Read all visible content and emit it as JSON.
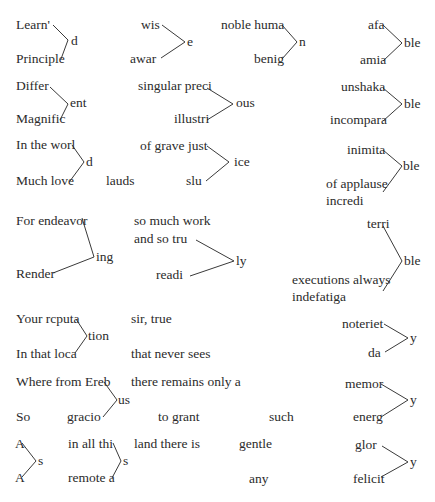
{
  "worksheet": {
    "groups": [
      {
        "id": "learned",
        "stems": [
          "Learn'",
          "Principle"
        ],
        "suffix": "d"
      },
      {
        "id": "wise-aware",
        "stems": [
          "wis",
          "awar"
        ],
        "suffix": "e"
      },
      {
        "id": "human-benign",
        "stems": [
          "noble huma",
          "benig"
        ],
        "suffix": "n"
      },
      {
        "id": "affable-amiable",
        "stems": [
          "afa",
          "amia"
        ],
        "suffix": "ble"
      },
      {
        "id": "different",
        "stems": [
          "Differ",
          "Magnific"
        ],
        "suffix": "ent"
      },
      {
        "id": "precious",
        "stems": [
          "singular preci",
          "illustri"
        ],
        "suffix": "ous"
      },
      {
        "id": "unshakable",
        "stems": [
          "unshaka",
          "incompara"
        ],
        "suffix": "ble"
      },
      {
        "id": "world-loved",
        "stems": [
          "In the worl",
          "Much love"
        ],
        "suffix": "d"
      },
      {
        "id": "justice",
        "stems": [
          "of grave just",
          "slu"
        ],
        "suffix": "ice"
      },
      {
        "id": "inimitable",
        "stems": [
          "inimita",
          "of applause",
          "incredi"
        ],
        "suffix": "ble"
      },
      {
        "id": "endeavoring",
        "stems": [
          "For endeavor",
          "Render"
        ],
        "suffix": "ing"
      },
      {
        "id": "truly",
        "stems": [
          "so much work",
          "and so tru",
          "readi"
        ],
        "suffix": "ly"
      },
      {
        "id": "terrible",
        "stems": [
          "terri",
          "executions always",
          "indefatiga"
        ],
        "suffix": "ble"
      },
      {
        "id": "reputation",
        "stems": [
          "Your rcputa",
          "In that loca"
        ],
        "suffix": "tion"
      },
      {
        "id": "notoriety",
        "stems": [
          "noteriet",
          "da"
        ],
        "suffix": "y"
      },
      {
        "id": "erebus",
        "stems": [
          "Where from Ereb",
          "gracio"
        ],
        "suffix": "us"
      },
      {
        "id": "memory",
        "stems": [
          "memor",
          "energ"
        ],
        "suffix": "y"
      },
      {
        "id": "as",
        "stems": [
          "A",
          "A"
        ],
        "suffix": "s"
      },
      {
        "id": "this",
        "stems": [
          "in all thi",
          "remote a"
        ],
        "suffix": "s"
      },
      {
        "id": "glory",
        "stems": [
          "glor",
          "felicit"
        ],
        "suffix": "y"
      }
    ],
    "loose_words": {
      "lauds": "lauds",
      "sir_true": "sir, true",
      "never_sees": "that never sees",
      "remains": "there remains only a",
      "so": "So",
      "to_grant": "to grant",
      "such": "such",
      "land": "land there is",
      "gentle": "gentle",
      "any": "any"
    }
  }
}
